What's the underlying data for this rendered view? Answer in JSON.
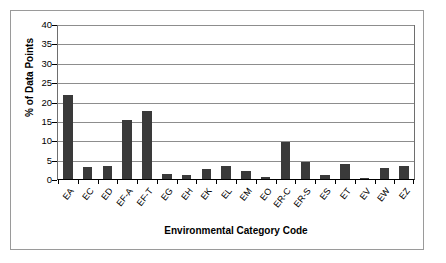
{
  "chart_data": {
    "type": "bar",
    "title": "",
    "xlabel": "Environmental Category Code",
    "ylabel": "% of Data Points",
    "ylim": [
      0,
      40
    ],
    "ytick_values": [
      40,
      35,
      30,
      25,
      20,
      15,
      10,
      5,
      0
    ],
    "ytick_labels": [
      "40",
      "35",
      "30",
      "25",
      "20",
      "15",
      "10",
      "5",
      "0"
    ],
    "grid": "horizontal",
    "legend": "none",
    "bar_color": "#3a3a3a",
    "categories": [
      "EA",
      "EC",
      "ED",
      "EF-A",
      "EF-T",
      "EG",
      "EH",
      "EK",
      "EL",
      "EM",
      "EO",
      "ER-C",
      "ER-S",
      "ES",
      "ET",
      "EV",
      "EW",
      "EZ"
    ],
    "values": [
      21.8,
      3.0,
      3.5,
      15.2,
      17.7,
      1.4,
      1.1,
      2.6,
      3.4,
      2.2,
      0.6,
      9.7,
      4.5,
      1.0,
      3.8,
      0.3,
      2.9,
      3.3
    ]
  }
}
